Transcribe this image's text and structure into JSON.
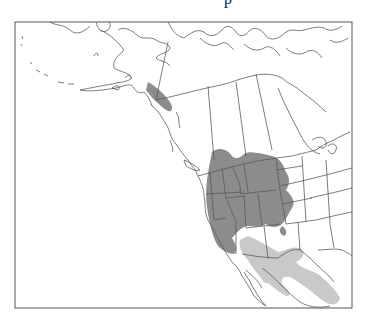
{
  "map": {
    "title_fragment": "p",
    "region": "North America (western)",
    "colors": {
      "frame": "#555555",
      "border": "#5a5a5a",
      "background": "#ffffff",
      "range_primary": "#8c8c8c",
      "range_secondary": "#c9c9c9"
    },
    "legend": []
  }
}
